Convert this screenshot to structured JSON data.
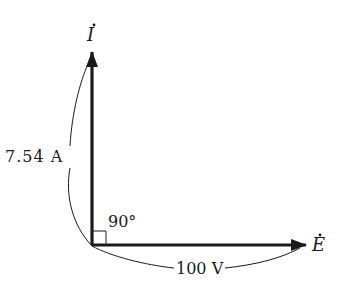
{
  "diagram": {
    "type": "phasor-diagram",
    "phasors": [
      {
        "name": "current",
        "symbol": "I",
        "dot": true,
        "magnitude_label": "7.54 A",
        "direction": "up"
      },
      {
        "name": "voltage",
        "symbol": "E",
        "dot": true,
        "magnitude_label": "100 V",
        "direction": "right"
      }
    ],
    "angle_label": "90°",
    "colors": {
      "stroke": "#1a1a1a",
      "background": "#ffffff"
    }
  }
}
